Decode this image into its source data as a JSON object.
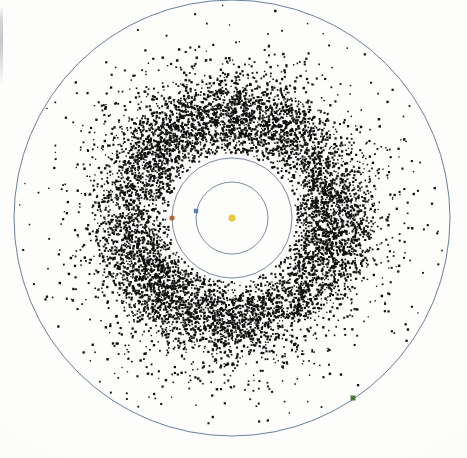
{
  "figure": {
    "name": "asteroid-belt-plot",
    "type": "solar-system-scatter",
    "width": 467,
    "height": 458,
    "background_color": "#fdfdfc"
  },
  "chart_data": {
    "type": "scatter",
    "title": "",
    "subtitle": "",
    "xlabel": "",
    "ylabel": "",
    "grid": false,
    "legend_position": "none",
    "projection": "ecliptic-plane-top-down",
    "center": {
      "x": 232,
      "y": 218
    },
    "xlim": [
      -233,
      234
    ],
    "ylim": [
      -240,
      218
    ],
    "axis_unit": "AU",
    "scale_px_per_au": 41.9,
    "point_count": 11000,
    "point_color": "#10100f",
    "point_size_px": 1.7,
    "belt": {
      "name": "main-asteroid-belt",
      "inner_radius_px": 68,
      "outer_radius_px": 152,
      "peak_radius_px": 104,
      "halo_outer_radius_px": 216,
      "inner_radius_au": 1.62,
      "outer_radius_au": 3.63,
      "peak_radius_au": 2.48
    },
    "orbits": [
      {
        "name": "earth-orbit",
        "label": "Earth",
        "radius_px": 36,
        "radius_au": 0.86,
        "stroke_color": "#6b7f99",
        "stroke_width": 0.9
      },
      {
        "name": "mars-orbit",
        "label": "Mars",
        "radius_px": 60,
        "radius_au": 1.43,
        "stroke_color": "#6b7f99",
        "stroke_width": 0.9
      },
      {
        "name": "jupiter-orbit",
        "label": "Jupiter",
        "radius_px": 218,
        "radius_au": 5.2,
        "stroke_color": "#6b7f99",
        "stroke_width": 1.0
      }
    ],
    "bodies": [
      {
        "name": "sun",
        "label": "Sun",
        "x": 232,
        "y": 218,
        "marker": "circle",
        "size_px": 7,
        "color": "#e8c83c"
      },
      {
        "name": "earth",
        "label": "Earth",
        "x": 196,
        "y": 211,
        "marker": "square",
        "size_px": 4.4,
        "color": "#5a7fb0"
      },
      {
        "name": "mars",
        "label": "Mars",
        "x": 172,
        "y": 218,
        "marker": "circle",
        "size_px": 5.2,
        "color": "#b4652c"
      },
      {
        "name": "jupiter",
        "label": "Jupiter",
        "x": 353,
        "y": 398,
        "marker": "square",
        "size_px": 5.0,
        "color": "#4a7a3c"
      }
    ]
  },
  "artifacts": {
    "scan_edge_mark": {
      "name": "scan-edge-artifact",
      "x": 0,
      "y": 6,
      "width": 3,
      "height": 78
    }
  }
}
